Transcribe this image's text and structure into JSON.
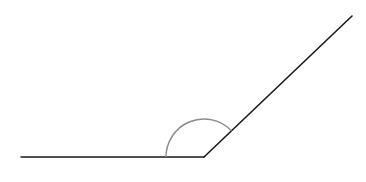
{
  "diagram": {
    "type": "angle",
    "canvas": {
      "width": 366,
      "height": 182,
      "background": "#ffffff"
    },
    "vertex": {
      "x": 204,
      "y": 157
    },
    "ray_left": {
      "x1": 21,
      "y1": 157,
      "x2": 204,
      "y2": 157,
      "color": "#1a1a1a",
      "width": 1.6
    },
    "ray_right": {
      "x1": 204,
      "y1": 157,
      "x2": 352,
      "y2": 16,
      "color": "#1a1a1a",
      "width": 1.6
    },
    "arc": {
      "radius": 38,
      "start": {
        "x": 166,
        "y": 157
      },
      "end": {
        "x": 231.4,
        "y": 130.7
      },
      "color": "#8a8a8a",
      "width": 1.4
    },
    "angle_degrees_approx": 136
  }
}
